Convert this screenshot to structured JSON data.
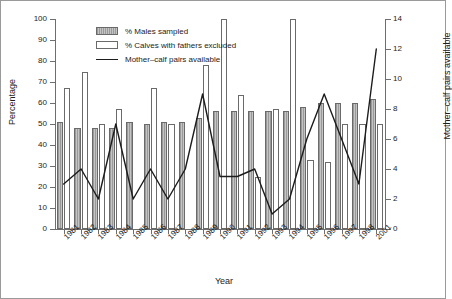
{
  "chart_data": {
    "type": "bar",
    "title": "",
    "xlabel": "Year",
    "ylabel": "Percentage",
    "ylabel_right": "Mother–calf pairs available",
    "categories": [
      "1981",
      "1982",
      "1983",
      "1984",
      "1985",
      "1986",
      "1987",
      "1988",
      "1989",
      "1990",
      "1991",
      "1992",
      "1993",
      "1994",
      "1995",
      "1996",
      "1997",
      "1998",
      "2001"
    ],
    "ylim": [
      0,
      100
    ],
    "yticks": [
      0,
      10,
      20,
      30,
      40,
      50,
      60,
      70,
      80,
      90,
      100
    ],
    "ylim_right": [
      0,
      14
    ],
    "yticks_right": [
      0,
      2,
      4,
      6,
      8,
      10,
      12,
      14
    ],
    "grid": false,
    "legend_position": "top-left",
    "series": [
      {
        "name": "% Males sampled",
        "type": "bar",
        "axis": "left",
        "values": [
          51,
          48,
          48,
          48,
          51,
          50,
          51,
          51,
          53,
          56,
          56,
          56,
          56,
          56,
          58,
          60,
          60,
          60,
          62
        ]
      },
      {
        "name": "% Calves with fathers excluded",
        "type": "bar",
        "axis": "left",
        "values": [
          67,
          75,
          50,
          57,
          null,
          67,
          50,
          null,
          78,
          100,
          64,
          25,
          57,
          100,
          33,
          32,
          50,
          50,
          50
        ]
      },
      {
        "name": "Mother–calf pairs available",
        "type": "line",
        "axis": "right",
        "values": [
          3,
          4,
          2,
          7,
          2,
          4,
          2,
          4,
          9,
          3.5,
          3.5,
          4,
          1,
          2,
          6,
          9,
          6,
          3,
          12
        ]
      }
    ]
  },
  "legend": {
    "items": [
      {
        "label": "% Males sampled",
        "swatch": "hatched-bar"
      },
      {
        "label": "% Calves with fathers excluded",
        "swatch": "white-bar"
      },
      {
        "label": "Mother–calf pairs available",
        "swatch": "line"
      }
    ]
  },
  "colors": {
    "bar_male_fill": "#b0b0b0",
    "bar_calf_fill": "#ffffff",
    "bar_border": "#6a6a6a",
    "line": "#1c1c1c",
    "axis": "#6e6e6e",
    "text": "#1c1c1c",
    "frame": "#9a9a9a",
    "background": "#ffffff"
  }
}
